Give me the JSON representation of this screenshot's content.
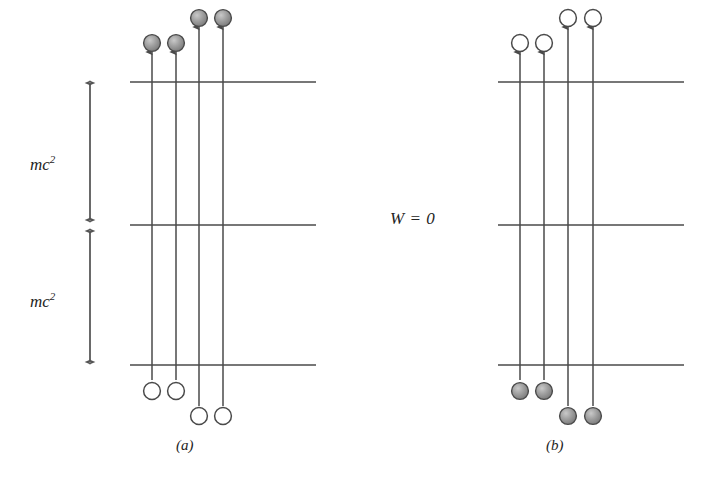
{
  "figure": {
    "background_color": "#ffffff",
    "line_color": "#4a4a4a",
    "text_color": "#242424",
    "filled_circle_color": "#8c8c8c",
    "open_circle_color": "#ffffff",
    "width": 711,
    "height": 484
  },
  "labels": {
    "energy_gap_upper": "mc",
    "energy_gap_upper_exponent": "2",
    "energy_gap_lower": "mc",
    "energy_gap_lower_exponent": "2",
    "zero_energy": "W = 0",
    "panel_a": "(a)",
    "panel_b": "(b)"
  },
  "scale_arrows": [
    {
      "name": "upper-mc2-arrow",
      "label": "mc^2",
      "x": 90,
      "y_top": 78,
      "y_bottom": 224,
      "double_headed": true
    },
    {
      "name": "lower-mc2-arrow",
      "label": "mc^2",
      "x": 90,
      "y_top": 226,
      "y_bottom": 366,
      "double_headed": true
    }
  ],
  "panels": [
    {
      "id": "a",
      "label": "(a)",
      "label_x": 176,
      "label_y": 437,
      "energy_levels": [
        {
          "name": "upper-continuum-level",
          "y": 82,
          "x_start": 130,
          "x_end": 316
        },
        {
          "name": "zero-energy-level",
          "y": 225,
          "x_start": 130,
          "x_end": 316
        },
        {
          "name": "negative-energy-level",
          "y": 365,
          "x_start": 130,
          "x_end": 316
        }
      ],
      "transitions": [
        {
          "name": "transition-1",
          "x": 152,
          "y_arrow_top": 52,
          "y_bottom": 380,
          "start_circle_y": 391,
          "end_circle_y": 43,
          "start_state": "open",
          "end_state": "filled"
        },
        {
          "name": "transition-2",
          "x": 176,
          "y_arrow_top": 52,
          "y_bottom": 380,
          "start_circle_y": 391,
          "end_circle_y": 43,
          "start_state": "open",
          "end_state": "filled"
        },
        {
          "name": "transition-3",
          "x": 199,
          "y_arrow_top": 27,
          "y_bottom": 406,
          "start_circle_y": 416,
          "end_circle_y": 18,
          "start_state": "open",
          "end_state": "filled"
        },
        {
          "name": "transition-4",
          "x": 223,
          "y_arrow_top": 27,
          "y_bottom": 406,
          "start_circle_y": 416,
          "end_circle_y": 18,
          "start_state": "open",
          "end_state": "filled"
        }
      ]
    },
    {
      "id": "b",
      "label": "(b)",
      "label_x": 546,
      "label_y": 437,
      "energy_levels": [
        {
          "name": "upper-continuum-level",
          "y": 82,
          "x_start": 498,
          "x_end": 684
        },
        {
          "name": "zero-energy-level",
          "y": 225,
          "x_start": 498,
          "x_end": 684
        },
        {
          "name": "negative-energy-level",
          "y": 365,
          "x_start": 498,
          "x_end": 684
        }
      ],
      "transitions": [
        {
          "name": "transition-1",
          "x": 520,
          "y_arrow_top": 52,
          "y_bottom": 380,
          "start_circle_y": 391,
          "end_circle_y": 43,
          "start_state": "filled",
          "end_state": "open"
        },
        {
          "name": "transition-2",
          "x": 544,
          "y_arrow_top": 52,
          "y_bottom": 380,
          "start_circle_y": 391,
          "end_circle_y": 43,
          "start_state": "filled",
          "end_state": "open"
        },
        {
          "name": "transition-3",
          "x": 568,
          "y_arrow_top": 27,
          "y_bottom": 406,
          "start_circle_y": 416,
          "end_circle_y": 18,
          "start_state": "filled",
          "end_state": "open"
        },
        {
          "name": "transition-4",
          "x": 593,
          "y_arrow_top": 27,
          "y_bottom": 406,
          "start_circle_y": 416,
          "end_circle_y": 18,
          "start_state": "filled",
          "end_state": "open"
        }
      ]
    }
  ]
}
